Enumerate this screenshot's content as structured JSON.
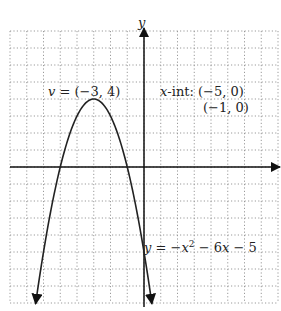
{
  "chart_data": {
    "type": "line",
    "title": "",
    "xlabel": "",
    "ylabel": "y",
    "xlim": [
      -8,
      8
    ],
    "ylim": [
      -8,
      8
    ],
    "grid": true,
    "grid_style": "dotted",
    "series": [
      {
        "name": "y = -x^2 - 6x - 5",
        "equation": "y = -x^2 - 6x - 5",
        "x": [
          -8.3,
          -8,
          -7,
          -6,
          -5,
          -4,
          -3,
          -2,
          -1,
          0,
          0.3
        ],
        "y": [
          -24.1,
          -21,
          -12,
          -5,
          0,
          3,
          4,
          3,
          0,
          -5,
          -6.9
        ]
      }
    ],
    "annotations": {
      "vertex": {
        "label": "v = (−3, 4)",
        "x": -3,
        "y": 4
      },
      "x_intercepts": {
        "label": "x-int: (−5, 0)",
        "second": "(−1, 0)",
        "points": [
          [
            -5,
            0
          ],
          [
            -1,
            0
          ]
        ]
      },
      "equation_label": "y = −x² − 6x − 5"
    }
  },
  "labels": {
    "y_axis": "y",
    "vertex_v": "v",
    "vertex_rest": " = (−3, 4)",
    "xint_x": "x",
    "xint_rest": "-int: (−5, 0)",
    "xint_second": "(−1, 0)",
    "eq_y": "y",
    "eq_eq": " = −",
    "eq_x": "x",
    "eq_sup": "2",
    "eq_mid": " − 6",
    "eq_x2": "x",
    "eq_end": " − 5"
  },
  "colors": {
    "curve": "#222222",
    "axis": "#111111",
    "grid": "#9a9a9a",
    "background": "#ffffff"
  }
}
